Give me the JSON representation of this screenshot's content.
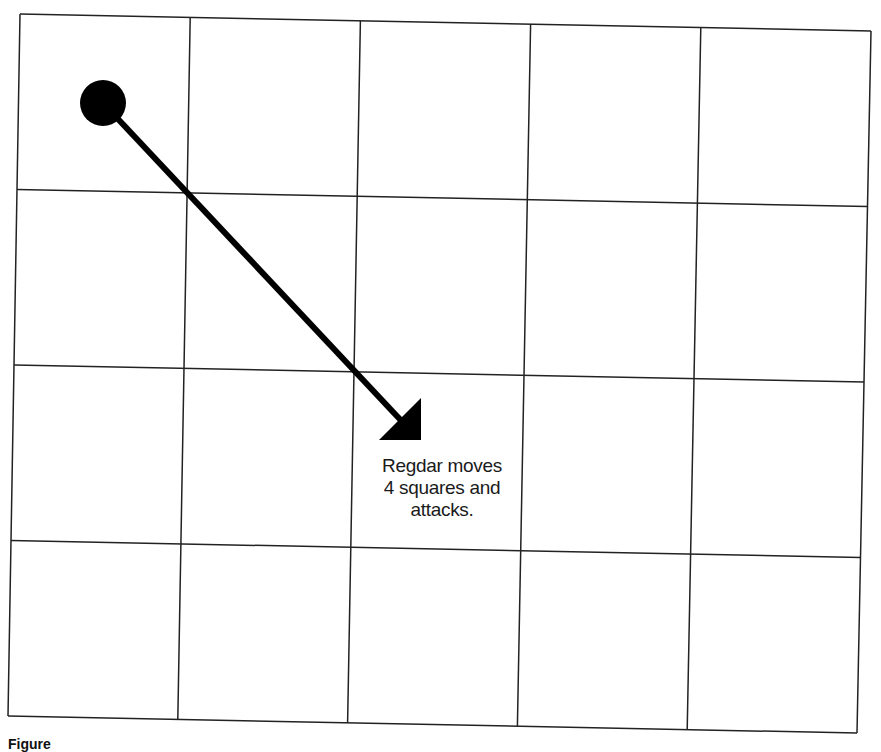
{
  "grid": {
    "rows": 4,
    "cols": 5,
    "corners": {
      "top_left": [
        20,
        14
      ],
      "top_right": [
        871,
        31
      ],
      "bottom_right": [
        857,
        733
      ],
      "bottom_left": [
        8,
        716
      ]
    },
    "line_color": "#222222"
  },
  "token": {
    "name": "Regdar",
    "shape": "circle",
    "center": [
      103,
      103
    ],
    "radius": 23,
    "color": "#000000"
  },
  "arrow": {
    "from": [
      103,
      103
    ],
    "to": [
      410,
      430
    ],
    "head": [
      [
        421,
        398
      ],
      [
        379,
        440
      ],
      [
        421,
        440
      ]
    ],
    "color": "#000000"
  },
  "label": {
    "lines": [
      "Regdar moves",
      "4 squares and",
      "attacks."
    ]
  },
  "caption": {
    "text": "Figure"
  }
}
